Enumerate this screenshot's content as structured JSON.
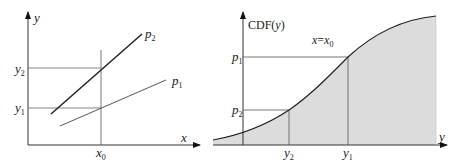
{
  "left_panel": {
    "y_axis_label": "y",
    "x_axis_label": "x",
    "x0_label": "x",
    "x0_sub": "0",
    "y1_label": "y",
    "y1_sub": "1",
    "y2_label": "y",
    "y2_sub": "2",
    "p1_label": "p",
    "p1_sub": "1",
    "p2_label": "p",
    "p2_sub": "2"
  },
  "right_panel": {
    "cdf_axis_label_prefix": "CDF(",
    "cdf_axis_label_var": "y",
    "cdf_axis_label_suffix": ")",
    "x_axis_label": "y",
    "condition_label_left": "x",
    "condition_label_eq": "=",
    "condition_label_right": "x",
    "condition_label_sub": "0",
    "p1_label": "p",
    "p1_sub": "1",
    "p2_label": "p",
    "p2_sub": "2",
    "y1_label": "y",
    "y1_sub": "1",
    "y2_label": "y",
    "y2_sub": "2",
    "fill_color": "#dcdcdc"
  }
}
